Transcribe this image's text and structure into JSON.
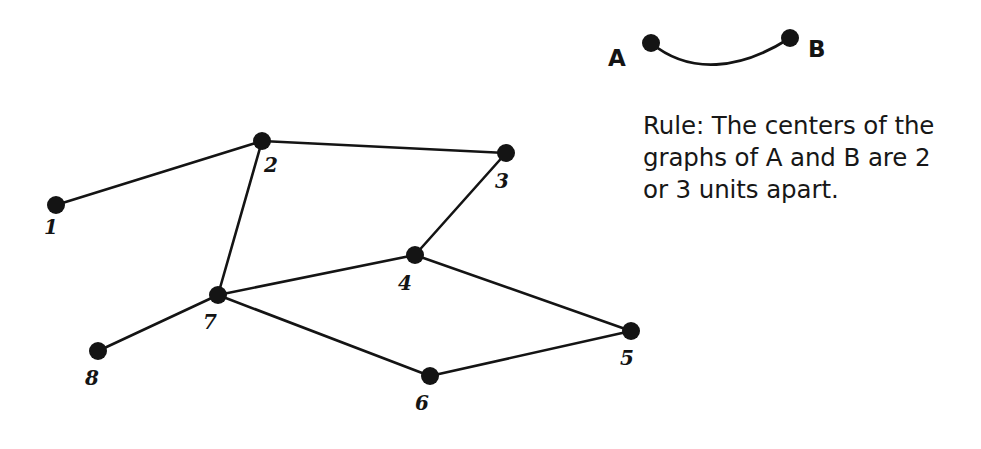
{
  "figure": {
    "background_color": "#ffffff",
    "ink_color": "#141414",
    "legend": {
      "curve_label_a": "A",
      "curve_label_b": "B",
      "a_point": {
        "x": 651,
        "y": 43
      },
      "b_point": {
        "x": 790,
        "y": 38
      },
      "curve_path": "M 651 43 C 690 75, 740 70, 790 38"
    },
    "rule": {
      "text": "Rule: The centers of the\ngraphs of A and B are 2\nor 3 units apart."
    },
    "graph": {
      "node_radius": 9,
      "edge_width": 2.6,
      "nodes": [
        {
          "id": "1",
          "label": "1",
          "x": 56,
          "y": 205,
          "label_x": 51,
          "label_y": 234
        },
        {
          "id": "2",
          "label": "2",
          "x": 262,
          "y": 141,
          "label_x": 271,
          "label_y": 172
        },
        {
          "id": "3",
          "label": "3",
          "x": 506,
          "y": 153,
          "label_x": 502,
          "label_y": 188
        },
        {
          "id": "4",
          "label": "4",
          "x": 415,
          "y": 255,
          "label_x": 405,
          "label_y": 290
        },
        {
          "id": "5",
          "label": "5",
          "x": 631,
          "y": 331,
          "label_x": 627,
          "label_y": 365
        },
        {
          "id": "6",
          "label": "6",
          "x": 430,
          "y": 376,
          "label_x": 422,
          "label_y": 410
        },
        {
          "id": "7",
          "label": "7",
          "x": 218,
          "y": 295,
          "label_x": 210,
          "label_y": 329
        },
        {
          "id": "8",
          "label": "8",
          "x": 98,
          "y": 351,
          "label_x": 92,
          "label_y": 385
        }
      ],
      "edges": [
        {
          "from": "1",
          "to": "2"
        },
        {
          "from": "2",
          "to": "3"
        },
        {
          "from": "2",
          "to": "7"
        },
        {
          "from": "3",
          "to": "4"
        },
        {
          "from": "4",
          "to": "7"
        },
        {
          "from": "4",
          "to": "5"
        },
        {
          "from": "5",
          "to": "6"
        },
        {
          "from": "6",
          "to": "7"
        },
        {
          "from": "7",
          "to": "8"
        }
      ]
    }
  }
}
